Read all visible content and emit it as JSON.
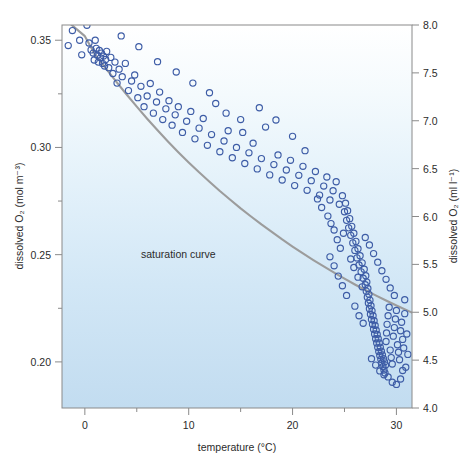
{
  "figure": {
    "background_color": "#ffffff",
    "plot_fill_top": "#ffffff",
    "plot_fill_bottom": "#c2dcf0",
    "frame_color": "#8a8a8a",
    "point_color": "#3d5ca6",
    "curve_color": "#9c9c9c"
  },
  "chart_data": {
    "type": "scatter",
    "title": "",
    "xlabel": "temperature (°C)",
    "ylabel": "dissolved O₂ (mol m⁻³)",
    "ylabel_right": "dissolved O₂ (ml l⁻¹)",
    "xlim": [
      -2.2,
      31.5
    ],
    "ylim": [
      0.1785,
      0.3571
    ],
    "ylim_right": [
      4.0,
      8.0
    ],
    "grid": false,
    "legend": "none",
    "xticks": [
      0,
      10,
      20,
      30
    ],
    "xtick_labels": [
      "0",
      "10",
      "20",
      "30"
    ],
    "xminor_ticks": [
      5,
      15,
      25
    ],
    "yticks": [
      0.2,
      0.25,
      0.3,
      0.35
    ],
    "ytick_labels": [
      "0.20",
      "0.25",
      "0.30",
      "0.35"
    ],
    "yminor_ticks": [
      0.225,
      0.275,
      0.325
    ],
    "yticks_right": [
      4.0,
      4.5,
      5.0,
      5.5,
      6.0,
      6.5,
      7.0,
      7.5,
      8.0
    ],
    "ytick_labels_right": [
      "4.0",
      "4.5",
      "5.0",
      "5.5",
      "6.0",
      "6.5",
      "7.0",
      "7.5",
      "8.0"
    ],
    "annotations": [
      {
        "text": "saturation curve",
        "x": 9.0,
        "y": 0.2505
      }
    ],
    "series": [
      {
        "name": "saturation curve",
        "type": "line",
        "color": "#9c9c9c",
        "x": [
          -2.2,
          -1.0,
          0.0,
          1.0,
          2.0,
          3.0,
          4.0,
          5.0,
          6.0,
          7.0,
          8.0,
          9.0,
          10.0,
          11.0,
          12.0,
          13.0,
          14.0,
          15.0,
          16.0,
          17.0,
          18.0,
          19.0,
          20.0,
          21.0,
          22.0,
          23.0,
          24.0,
          25.0,
          26.0,
          27.0,
          28.0,
          29.0,
          30.0,
          31.5
        ],
        "y": [
          0.361,
          0.356,
          0.3519,
          0.3432,
          0.337,
          0.3308,
          0.3248,
          0.319,
          0.3134,
          0.308,
          0.3028,
          0.2978,
          0.293,
          0.2884,
          0.284,
          0.2797,
          0.2756,
          0.2716,
          0.2678,
          0.2641,
          0.2606,
          0.2571,
          0.2538,
          0.2506,
          0.2475,
          0.2445,
          0.2416,
          0.2388,
          0.2361,
          0.2335,
          0.231,
          0.2286,
          0.2263,
          0.223
        ]
      },
      {
        "name": "observations",
        "type": "scatter",
        "marker": "open-circle",
        "color": "#3d5ca6",
        "points": [
          [
            -1.6,
            0.3475
          ],
          [
            -1.2,
            0.3545
          ],
          [
            -0.5,
            0.35
          ],
          [
            -0.3,
            0.3432
          ],
          [
            0.2,
            0.357
          ],
          [
            0.4,
            0.3487
          ],
          [
            0.6,
            0.3455
          ],
          [
            0.8,
            0.344
          ],
          [
            0.9,
            0.3408
          ],
          [
            1.0,
            0.35
          ],
          [
            1.1,
            0.3462
          ],
          [
            1.2,
            0.343
          ],
          [
            1.3,
            0.3398
          ],
          [
            1.4,
            0.3452
          ],
          [
            1.5,
            0.3418
          ],
          [
            1.6,
            0.344
          ],
          [
            1.7,
            0.3392
          ],
          [
            1.8,
            0.3426
          ],
          [
            1.9,
            0.338
          ],
          [
            2.0,
            0.341
          ],
          [
            2.1,
            0.3448
          ],
          [
            2.3,
            0.3372
          ],
          [
            2.5,
            0.342
          ],
          [
            2.7,
            0.3345
          ],
          [
            2.9,
            0.3398
          ],
          [
            3.1,
            0.33
          ],
          [
            3.3,
            0.3365
          ],
          [
            3.6,
            0.333
          ],
          [
            3.9,
            0.3392
          ],
          [
            4.2,
            0.3265
          ],
          [
            4.5,
            0.331
          ],
          [
            4.8,
            0.3338
          ],
          [
            5.1,
            0.3232
          ],
          [
            5.4,
            0.3285
          ],
          [
            5.7,
            0.319
          ],
          [
            6.0,
            0.324
          ],
          [
            6.3,
            0.3298
          ],
          [
            6.6,
            0.316
          ],
          [
            6.9,
            0.3212
          ],
          [
            7.2,
            0.3258
          ],
          [
            7.5,
            0.313
          ],
          [
            7.8,
            0.318
          ],
          [
            8.1,
            0.3218
          ],
          [
            8.4,
            0.3104
          ],
          [
            8.7,
            0.3152
          ],
          [
            9.0,
            0.319
          ],
          [
            9.4,
            0.307
          ],
          [
            9.8,
            0.3122
          ],
          [
            10.2,
            0.3168
          ],
          [
            10.6,
            0.304
          ],
          [
            11.0,
            0.309
          ],
          [
            11.4,
            0.3135
          ],
          [
            11.8,
            0.301
          ],
          [
            12.2,
            0.306
          ],
          [
            12.6,
            0.3205
          ],
          [
            13.0,
            0.298
          ],
          [
            13.4,
            0.303
          ],
          [
            13.8,
            0.3078
          ],
          [
            14.2,
            0.2952
          ],
          [
            14.6,
            0.3
          ],
          [
            15.0,
            0.313
          ],
          [
            15.4,
            0.2925
          ],
          [
            15.8,
            0.2975
          ],
          [
            16.2,
            0.302
          ],
          [
            16.6,
            0.29
          ],
          [
            17.0,
            0.2948
          ],
          [
            17.4,
            0.3095
          ],
          [
            17.8,
            0.2872
          ],
          [
            18.2,
            0.292
          ],
          [
            18.6,
            0.2965
          ],
          [
            19.0,
            0.2848
          ],
          [
            19.4,
            0.2895
          ],
          [
            19.8,
            0.294
          ],
          [
            20.2,
            0.2822
          ],
          [
            20.6,
            0.287
          ],
          [
            21.0,
            0.2912
          ],
          [
            21.4,
            0.28
          ],
          [
            21.8,
            0.2845
          ],
          [
            22.2,
            0.2888
          ],
          [
            22.6,
            0.2778
          ],
          [
            23.0,
            0.282
          ],
          [
            23.3,
            0.2862
          ],
          [
            23.6,
            0.2755
          ],
          [
            23.9,
            0.2798
          ],
          [
            24.2,
            0.284
          ],
          [
            24.5,
            0.2735
          ],
          [
            24.8,
            0.2775
          ],
          [
            25.0,
            0.27
          ],
          [
            25.1,
            0.274
          ],
          [
            25.2,
            0.266
          ],
          [
            25.3,
            0.2705
          ],
          [
            25.4,
            0.2625
          ],
          [
            25.5,
            0.2668
          ],
          [
            25.6,
            0.259
          ],
          [
            25.7,
            0.2632
          ],
          [
            25.8,
            0.2555
          ],
          [
            25.9,
            0.26
          ],
          [
            26.0,
            0.252
          ],
          [
            26.1,
            0.2562
          ],
          [
            26.2,
            0.2485
          ],
          [
            26.3,
            0.2528
          ],
          [
            26.4,
            0.2452
          ],
          [
            26.5,
            0.2495
          ],
          [
            26.6,
            0.242
          ],
          [
            26.7,
            0.2462
          ],
          [
            26.8,
            0.239
          ],
          [
            26.9,
            0.2432
          ],
          [
            27.0,
            0.236
          ],
          [
            27.05,
            0.2402
          ],
          [
            27.1,
            0.233
          ],
          [
            27.15,
            0.2372
          ],
          [
            27.2,
            0.2302
          ],
          [
            27.25,
            0.2342
          ],
          [
            27.3,
            0.2275
          ],
          [
            27.35,
            0.2315
          ],
          [
            27.4,
            0.2248
          ],
          [
            27.45,
            0.2288
          ],
          [
            27.5,
            0.2222
          ],
          [
            27.55,
            0.2262
          ],
          [
            27.6,
            0.2198
          ],
          [
            27.65,
            0.2238
          ],
          [
            27.7,
            0.2175
          ],
          [
            27.75,
            0.2215
          ],
          [
            27.8,
            0.2152
          ],
          [
            27.85,
            0.2192
          ],
          [
            27.9,
            0.213
          ],
          [
            27.95,
            0.217
          ],
          [
            28.0,
            0.2108
          ],
          [
            28.05,
            0.2148
          ],
          [
            28.1,
            0.2088
          ],
          [
            28.15,
            0.2128
          ],
          [
            28.2,
            0.2068
          ],
          [
            28.25,
            0.2108
          ],
          [
            28.3,
            0.2048
          ],
          [
            28.35,
            0.2088
          ],
          [
            28.4,
            0.203
          ],
          [
            28.45,
            0.2068
          ],
          [
            28.5,
            0.2012
          ],
          [
            28.55,
            0.205
          ],
          [
            28.6,
            0.1995
          ],
          [
            28.65,
            0.2032
          ],
          [
            28.7,
            0.1978
          ],
          [
            28.75,
            0.2015
          ],
          [
            28.8,
            0.1962
          ],
          [
            28.85,
            0.2
          ],
          [
            28.9,
            0.1948
          ],
          [
            28.95,
            0.1985
          ],
          [
            29.0,
            0.2095
          ],
          [
            29.05,
            0.2135
          ],
          [
            29.1,
            0.2175
          ],
          [
            29.2,
            0.2215
          ],
          [
            29.3,
            0.2255
          ],
          [
            29.4,
            0.2055
          ],
          [
            29.5,
            0.202
          ],
          [
            29.6,
            0.199
          ],
          [
            29.7,
            0.212
          ],
          [
            29.8,
            0.216
          ],
          [
            29.9,
            0.22
          ],
          [
            30.0,
            0.224
          ],
          [
            30.1,
            0.208
          ],
          [
            30.2,
            0.2045
          ],
          [
            30.3,
            0.201
          ],
          [
            30.4,
            0.2145
          ],
          [
            30.5,
            0.2185
          ],
          [
            30.6,
            0.2105
          ],
          [
            30.7,
            0.2065
          ],
          [
            30.8,
            0.2225
          ],
          [
            30.9,
            0.1975
          ],
          [
            24.0,
            0.2615
          ],
          [
            24.3,
            0.257
          ],
          [
            24.6,
            0.253
          ],
          [
            24.9,
            0.26
          ],
          [
            23.4,
            0.268
          ],
          [
            23.7,
            0.2645
          ],
          [
            22.8,
            0.272
          ],
          [
            22.4,
            0.276
          ],
          [
            25.6,
            0.248
          ],
          [
            25.9,
            0.244
          ],
          [
            26.3,
            0.2395
          ],
          [
            26.7,
            0.235
          ],
          [
            27.0,
            0.258
          ],
          [
            27.4,
            0.2545
          ],
          [
            27.8,
            0.2505
          ],
          [
            28.2,
            0.2465
          ],
          [
            28.6,
            0.2425
          ],
          [
            29.0,
            0.2385
          ],
          [
            29.4,
            0.2345
          ],
          [
            29.8,
            0.231
          ],
          [
            21.2,
            0.2985
          ],
          [
            20.0,
            0.3052
          ],
          [
            18.4,
            0.3128
          ],
          [
            16.8,
            0.3185
          ],
          [
            15.2,
            0.307
          ],
          [
            13.6,
            0.316
          ],
          [
            12.0,
            0.3255
          ],
          [
            10.4,
            0.33
          ],
          [
            8.8,
            0.3352
          ],
          [
            7.0,
            0.34
          ],
          [
            5.2,
            0.347
          ],
          [
            3.5,
            0.352
          ],
          [
            26.0,
            0.226
          ],
          [
            26.4,
            0.2215
          ],
          [
            26.8,
            0.218
          ],
          [
            25.2,
            0.231
          ],
          [
            24.8,
            0.2355
          ],
          [
            24.4,
            0.24
          ],
          [
            24.0,
            0.2448
          ],
          [
            23.6,
            0.249
          ],
          [
            29.2,
            0.193
          ],
          [
            29.6,
            0.1905
          ],
          [
            30.0,
            0.1895
          ],
          [
            30.4,
            0.192
          ],
          [
            28.8,
            0.194
          ],
          [
            28.4,
            0.1958
          ],
          [
            28.0,
            0.1985
          ],
          [
            27.6,
            0.2015
          ],
          [
            30.8,
            0.229
          ],
          [
            31.0,
            0.213
          ],
          [
            31.1,
            0.2035
          ],
          [
            30.6,
            0.196
          ]
        ]
      }
    ]
  }
}
